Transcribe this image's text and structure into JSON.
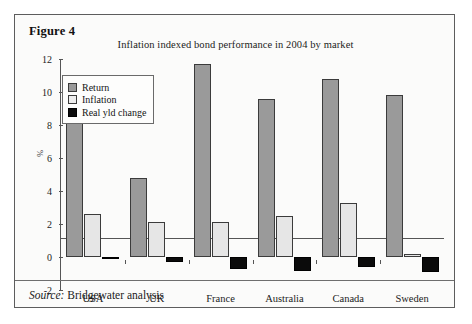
{
  "figure": {
    "caption": "Figure 4",
    "source_label": "Source:",
    "source_text": "Bridgewater analysis"
  },
  "colors": {
    "return": "#9a9a9a",
    "inflation": "#e6e6e6",
    "real_yld_change": "#0b0b0b",
    "axis": "#555555",
    "frame": "#5d5d5d",
    "panel_background": "#fbfbfa"
  },
  "chart_data": {
    "type": "bar",
    "title": "Inflation indexed bond performance in 2004 by market",
    "xlabel": "",
    "ylabel": "%",
    "ylim": [
      -2,
      12
    ],
    "yticks": [
      12,
      10,
      8,
      6,
      4,
      2,
      0,
      -2
    ],
    "ytick_labels": [
      "12",
      "10",
      "8",
      "6",
      "4",
      "2",
      "0",
      "-2"
    ],
    "grid": false,
    "legend_position": "upper-left-inside",
    "categories": [
      "USA",
      "UK",
      "France",
      "Australia",
      "Canada",
      "Sweden"
    ],
    "series": [
      {
        "name": "Return",
        "values": [
          9.8,
          4.8,
          11.7,
          9.6,
          10.8,
          9.8
        ]
      },
      {
        "name": "Inflation",
        "values": [
          2.6,
          2.1,
          2.1,
          2.5,
          3.3,
          0.2
        ]
      },
      {
        "name": "Real yld change",
        "values": [
          -0.15,
          -0.3,
          -0.75,
          -0.85,
          -0.6,
          -0.9
        ]
      }
    ]
  }
}
